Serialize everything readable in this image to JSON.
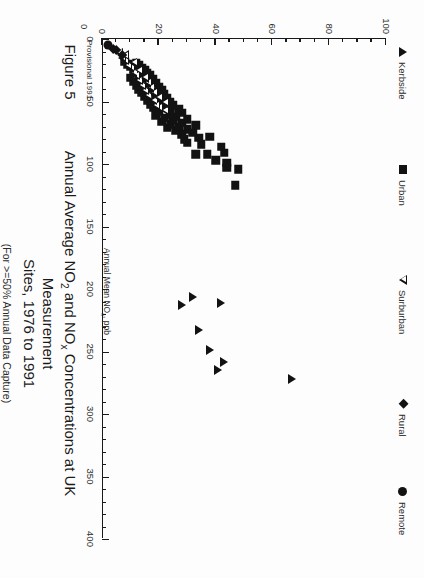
{
  "figure": {
    "number_label": "Figure 5",
    "title": "Annual Average NO2 and NOx Concentrations at UK Measurement Sites, 1976 to 1991",
    "title_line1_a": "Annual Average NO",
    "title_line1_sub1": "2",
    "title_line1_b": " and NO",
    "title_line1_sub2": "x",
    "title_line1_c": " Concentrations at UK Measurement",
    "title_line2": "Sites, 1976 to 1991",
    "subtitle": "(For >=50% Annual Data Capture)",
    "provisional_note": "Provisional 1991"
  },
  "axes": {
    "x_title_a": "Annual Mean NO",
    "x_title_sub": "x",
    "x_title_b": ", ppb",
    "x_title_full": "Annual Mean NOx, ppb",
    "x_labels": [
      "0",
      "50",
      "100",
      "150",
      "200",
      "250",
      "300",
      "350",
      "400"
    ],
    "y_labels": [
      "0",
      "20",
      "40",
      "60",
      "80",
      "100"
    ],
    "corner_zero": "0"
  },
  "legend": {
    "items": [
      {
        "label": "Kerbside",
        "marker": "filled-left-triangle-icon"
      },
      {
        "label": "Urban",
        "marker": "filled-square-icon"
      },
      {
        "label": "Surburban",
        "marker": "open-triangle-icon"
      },
      {
        "label": "Rural",
        "marker": "filled-diamond-icon"
      },
      {
        "label": "Remote",
        "marker": "filled-circle-icon"
      }
    ]
  },
  "chart_data": {
    "type": "scatter",
    "title": "Annual Average NO2 and NOx Concentrations at UK Measurement Sites, 1976 to 1991",
    "subtitle": "(For >=50% Annual Data Capture)",
    "xlabel": "Annual Mean NOx, ppb",
    "ylabel": "Annual Mean NO2, ppb",
    "xlim": [
      0,
      400
    ],
    "ylim": [
      0,
      100
    ],
    "x_ticks_major": [
      0,
      50,
      100,
      150,
      200,
      250,
      300,
      350,
      400
    ],
    "x_tick_minor_step": 10,
    "y_ticks_major": [
      0,
      20,
      40,
      60,
      80,
      100
    ],
    "y_tick_minor_step": 5,
    "grid": false,
    "legend_position": "top",
    "series": [
      {
        "name": "Kerbside",
        "marker": "filled-left-triangle-icon",
        "color": "#121212",
        "points": [
          [
            272,
            67
          ],
          [
            258,
            43
          ],
          [
            265,
            41
          ],
          [
            249,
            38
          ],
          [
            233,
            34
          ],
          [
            213,
            28
          ],
          [
            211,
            42
          ],
          [
            206,
            32
          ]
        ]
      },
      {
        "name": "Urban",
        "marker": "filled-square-icon",
        "color": "#121212",
        "points": [
          [
            117,
            47
          ],
          [
            103,
            44
          ],
          [
            104,
            48
          ],
          [
            97,
            40
          ],
          [
            99,
            44
          ],
          [
            91,
            43
          ],
          [
            92,
            37
          ],
          [
            92,
            33
          ],
          [
            86,
            42
          ],
          [
            84,
            35
          ],
          [
            83,
            30
          ],
          [
            79,
            34
          ],
          [
            80,
            29
          ],
          [
            78,
            38
          ],
          [
            76,
            28
          ],
          [
            75,
            32
          ],
          [
            73,
            26
          ],
          [
            72,
            30
          ],
          [
            71,
            23
          ],
          [
            70,
            27
          ],
          [
            69,
            33
          ],
          [
            68,
            24
          ],
          [
            67,
            28
          ],
          [
            66,
            21
          ],
          [
            65,
            25
          ],
          [
            64,
            30
          ],
          [
            63,
            22
          ],
          [
            62,
            26
          ],
          [
            61,
            19
          ],
          [
            60,
            24
          ],
          [
            59,
            28
          ],
          [
            58,
            20
          ],
          [
            57,
            24
          ],
          [
            56,
            27
          ],
          [
            55,
            18
          ],
          [
            54,
            22
          ],
          [
            53,
            25
          ],
          [
            52,
            17
          ],
          [
            51,
            21
          ],
          [
            50,
            24
          ],
          [
            49,
            16
          ],
          [
            48,
            20
          ],
          [
            47,
            23
          ],
          [
            46,
            15
          ],
          [
            45,
            19
          ],
          [
            44,
            22
          ],
          [
            43,
            14
          ],
          [
            42,
            18
          ],
          [
            41,
            21
          ],
          [
            40,
            13
          ],
          [
            39,
            17
          ],
          [
            38,
            20
          ],
          [
            37,
            12
          ],
          [
            36,
            16
          ],
          [
            35,
            19
          ],
          [
            34,
            11
          ],
          [
            33,
            15
          ],
          [
            32,
            18
          ],
          [
            31,
            10
          ],
          [
            30,
            14
          ],
          [
            29,
            17
          ],
          [
            28,
            13
          ],
          [
            27,
            16
          ],
          [
            26,
            12
          ],
          [
            25,
            15
          ],
          [
            24,
            11
          ],
          [
            23,
            14
          ],
          [
            22,
            10
          ],
          [
            21,
            13
          ],
          [
            20,
            9
          ],
          [
            19,
            12
          ],
          [
            18,
            8
          ]
        ]
      },
      {
        "name": "Surburban",
        "marker": "open-triangle-icon",
        "color": "#121212",
        "points": [
          [
            57,
            22
          ],
          [
            55,
            20
          ],
          [
            53,
            19
          ],
          [
            51,
            22
          ],
          [
            49,
            18
          ],
          [
            47,
            20
          ],
          [
            45,
            16
          ],
          [
            43,
            18
          ],
          [
            41,
            15
          ],
          [
            39,
            17
          ],
          [
            37,
            14
          ],
          [
            35,
            16
          ],
          [
            33,
            13
          ],
          [
            31,
            15
          ],
          [
            29,
            12
          ],
          [
            27,
            11
          ],
          [
            25,
            13
          ],
          [
            23,
            10
          ],
          [
            21,
            9
          ],
          [
            19,
            11
          ],
          [
            17,
            8
          ],
          [
            15,
            7
          ],
          [
            13,
            8
          ],
          [
            11,
            6
          ]
        ]
      },
      {
        "name": "Rural",
        "marker": "filled-diamond-icon",
        "color": "#121212",
        "points": [
          [
            13,
            7
          ],
          [
            9,
            5
          ],
          [
            8,
            4
          ]
        ]
      },
      {
        "name": "Remote",
        "marker": "filled-circle-icon",
        "color": "#121212",
        "points": [
          [
            5,
            2
          ]
        ]
      }
    ]
  }
}
